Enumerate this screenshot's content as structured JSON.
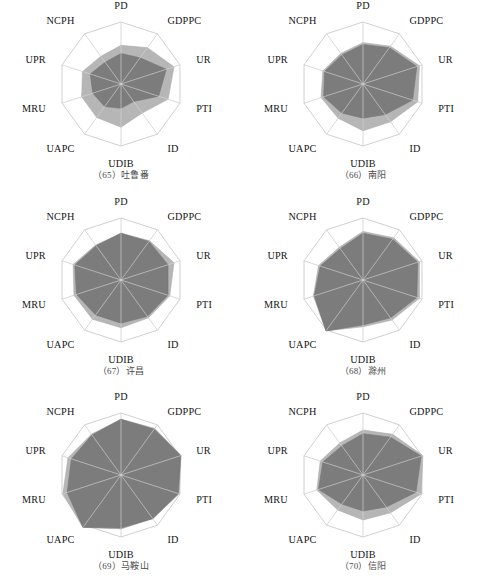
{
  "figure": {
    "type": "radar-chart-grid",
    "columns": 2,
    "rows": 3,
    "axis_labels": [
      "PD",
      "GDPPC",
      "UR",
      "PTI",
      "ID",
      "UDIB",
      "UAPC",
      "MRU",
      "UPR",
      "NCPH"
    ],
    "colors": {
      "outer_fill": "#b6b6b6",
      "inner_fill": "#7c7c7c",
      "grid": "#c4c4c4",
      "text": "#151515",
      "caption": "#4a4a4a",
      "background": "#ffffff"
    },
    "rings": [
      0.5,
      1.0
    ]
  },
  "chart_data": [
    {
      "type": "radar",
      "index": "65",
      "caption": "（65）吐鲁番",
      "title": "吐鲁番",
      "categories": [
        "PD",
        "GDPPC",
        "UR",
        "PTI",
        "ID",
        "UDIB",
        "UAPC",
        "MRU",
        "UPR",
        "NCPH"
      ],
      "rlim": [
        0,
        1
      ],
      "grid": true,
      "legend": "none",
      "series": [
        {
          "name": "outer",
          "values": [
            0.43,
            0.5,
            0.62,
            0.55,
            0.4,
            0.48,
            0.46,
            0.46,
            0.45,
            0.38
          ]
        },
        {
          "name": "inner",
          "values": [
            0.34,
            0.36,
            0.53,
            0.44,
            0.24,
            0.27,
            0.31,
            0.33,
            0.36,
            0.3
          ]
        }
      ]
    },
    {
      "type": "radar",
      "index": "66",
      "caption": "（66）南阳",
      "title": "南阳",
      "categories": [
        "PD",
        "GDPPC",
        "UR",
        "PTI",
        "ID",
        "UDIB",
        "UAPC",
        "MRU",
        "UPR",
        "NCPH"
      ],
      "rlim": [
        0,
        1
      ],
      "grid": true,
      "legend": "none",
      "series": [
        {
          "name": "outer",
          "values": [
            0.46,
            0.52,
            0.66,
            0.64,
            0.52,
            0.52,
            0.47,
            0.49,
            0.47,
            0.42
          ]
        },
        {
          "name": "inner",
          "values": [
            0.44,
            0.5,
            0.63,
            0.58,
            0.42,
            0.38,
            0.4,
            0.46,
            0.45,
            0.4
          ]
        }
      ]
    },
    {
      "type": "radar",
      "index": "67",
      "caption": "（67）许昌",
      "title": "许昌",
      "categories": [
        "PD",
        "GDPPC",
        "UR",
        "PTI",
        "ID",
        "UDIB",
        "UAPC",
        "MRU",
        "UPR",
        "NCPH"
      ],
      "rlim": [
        0,
        1
      ],
      "grid": true,
      "legend": "none",
      "series": [
        {
          "name": "outer",
          "values": [
            0.52,
            0.54,
            0.62,
            0.57,
            0.52,
            0.53,
            0.54,
            0.55,
            0.56,
            0.48
          ]
        },
        {
          "name": "inner",
          "values": [
            0.52,
            0.53,
            0.55,
            0.55,
            0.5,
            0.48,
            0.48,
            0.52,
            0.54,
            0.47
          ]
        }
      ]
    },
    {
      "type": "radar",
      "index": "68",
      "caption": "（68）滁州",
      "title": "滁州",
      "categories": [
        "PD",
        "GDPPC",
        "UR",
        "PTI",
        "ID",
        "UDIB",
        "UAPC",
        "MRU",
        "UPR",
        "NCPH"
      ],
      "rlim": [
        0,
        1
      ],
      "grid": true,
      "legend": "none",
      "series": [
        {
          "name": "outer",
          "values": [
            0.54,
            0.58,
            0.66,
            0.66,
            0.55,
            0.52,
            0.7,
            0.58,
            0.52,
            0.45
          ]
        },
        {
          "name": "inner",
          "values": [
            0.52,
            0.56,
            0.64,
            0.63,
            0.52,
            0.5,
            0.7,
            0.57,
            0.5,
            0.43
          ]
        }
      ]
    },
    {
      "type": "radar",
      "index": "69",
      "caption": "（69）马鞍山",
      "title": "马鞍山",
      "categories": [
        "PD",
        "GDPPC",
        "UR",
        "PTI",
        "ID",
        "UDIB",
        "UAPC",
        "MRU",
        "UPR",
        "NCPH"
      ],
      "rlim": [
        0,
        1
      ],
      "grid": true,
      "legend": "none",
      "series": [
        {
          "name": "outer",
          "values": [
            0.62,
            0.64,
            0.7,
            0.68,
            0.6,
            0.6,
            0.72,
            0.68,
            0.62,
            0.56
          ]
        },
        {
          "name": "inner",
          "values": [
            0.62,
            0.63,
            0.7,
            0.67,
            0.6,
            0.59,
            0.72,
            0.63,
            0.58,
            0.55
          ]
        }
      ]
    },
    {
      "type": "radar",
      "index": "70",
      "caption": "（70）信阳",
      "title": "信阳",
      "categories": [
        "PD",
        "GDPPC",
        "UR",
        "PTI",
        "ID",
        "UDIB",
        "UAPC",
        "MRU",
        "UPR",
        "NCPH"
      ],
      "rlim": [
        0,
        1
      ],
      "grid": true,
      "legend": "none",
      "series": [
        {
          "name": "outer",
          "values": [
            0.5,
            0.56,
            0.7,
            0.68,
            0.52,
            0.5,
            0.48,
            0.54,
            0.5,
            0.44
          ]
        },
        {
          "name": "inner",
          "values": [
            0.46,
            0.52,
            0.68,
            0.62,
            0.44,
            0.4,
            0.4,
            0.52,
            0.47,
            0.4
          ]
        }
      ]
    }
  ]
}
